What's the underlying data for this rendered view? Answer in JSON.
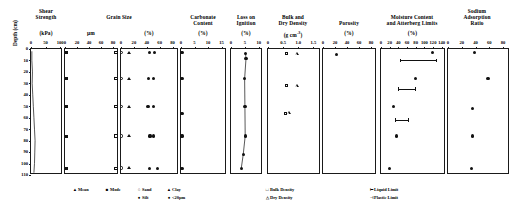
{
  "figure": {
    "depth_axis": {
      "title": "Depth (cm)",
      "ticks": [
        0,
        10,
        20,
        30,
        40,
        50,
        60,
        70,
        80,
        90,
        100,
        110
      ],
      "min": 0,
      "max": 110
    },
    "panels": [
      {
        "id": "shear-strength",
        "title_lines": [
          "Shear",
          "Strength"
        ],
        "unit": "(kPa)",
        "ticks": [
          0,
          50,
          100
        ],
        "min": 0,
        "max": 110
      },
      {
        "id": "grain-size-um",
        "title_lines": [
          "Grain Size"
        ],
        "unit": "µm",
        "ticks": [
          0,
          20,
          40,
          60,
          80
        ],
        "min": 0,
        "max": 90
      },
      {
        "id": "grain-size-pct",
        "title_lines": [],
        "unit": "(%)",
        "ticks": [
          0,
          20,
          40,
          60,
          80
        ],
        "min": 0,
        "max": 90
      },
      {
        "id": "carbonate-content",
        "title_lines": [
          "Carbonate",
          "Content"
        ],
        "unit": "(%)",
        "ticks": [
          0,
          5,
          10,
          15
        ],
        "min": 0,
        "max": 17
      },
      {
        "id": "loss-on-ignition",
        "title_lines": [
          "Loss on",
          "Ignition"
        ],
        "unit": "(%)",
        "ticks": [
          0,
          5,
          10
        ],
        "min": 0,
        "max": 11.5
      },
      {
        "id": "bulk-dry-density",
        "title_lines": [
          "Bulk and",
          "Dry Density"
        ],
        "unit": "(g cm-3)",
        "unit_base": "(g cm",
        "unit_sup": "-3",
        "unit_close": ")",
        "ticks": [
          0,
          0.5,
          1.0,
          1.5
        ],
        "min": 0,
        "max": 1.75
      },
      {
        "id": "porosity",
        "title_lines": [
          "Porosity"
        ],
        "unit": "(%)",
        "ticks": [
          0,
          20,
          40,
          60,
          80
        ],
        "min": 0,
        "max": 90
      },
      {
        "id": "moisture-atterberg",
        "title_lines": [
          "Moisture Content",
          "and Atterberg Limits"
        ],
        "unit": "(%)",
        "ticks": [
          0,
          20,
          40,
          60,
          80,
          100,
          120,
          140
        ],
        "min": 0,
        "max": 150
      },
      {
        "id": "sodium-adsorption-ratio",
        "title_lines": [
          "Sodium",
          "Adsorption",
          "Ratio"
        ],
        "unit": "",
        "ticks": [
          0,
          20,
          40,
          60,
          80
        ],
        "min": 0,
        "max": 90
      }
    ],
    "legends": [
      {
        "id": "legend-mean",
        "marker": "▲",
        "label": "Mean"
      },
      {
        "id": "legend-mode",
        "marker": "■",
        "label": "Mode"
      },
      {
        "id": "legend-sand",
        "marker": "○",
        "label": "Sand"
      },
      {
        "id": "legend-clay",
        "marker": "▲",
        "label": "Clay"
      },
      {
        "id": "legend-silt",
        "marker": "●",
        "label": "Silt"
      },
      {
        "id": "legend-u20",
        "marker": "●",
        "label": "<20µm"
      },
      {
        "id": "legend-bulk-density",
        "marker": "□",
        "label": "Bulk Density"
      },
      {
        "id": "legend-dry-density",
        "marker": "△",
        "label": "Dry Density"
      },
      {
        "id": "legend-liquid-limit",
        "marker": "⊢",
        "label": "Liquid Limit"
      },
      {
        "id": "legend-plastic-limit",
        "marker": "⊣",
        "label": "Plastic Limit"
      }
    ]
  },
  "chart_data": {
    "type": "scatter",
    "ylabel": "Depth (cm)",
    "ylim": [
      0,
      110
    ],
    "grid": false,
    "legend_position": "bottom",
    "subplots": [
      {
        "name": "Shear Strength",
        "xlabel": "Shear Strength (kPa)",
        "xlim": [
          0,
          110
        ],
        "xticks": [
          0,
          50,
          100
        ],
        "series": [
          {
            "name": "Shear strength profile",
            "type": "line",
            "x": [
              3,
              3,
              5,
              4,
              6,
              8,
              10,
              12,
              14,
              13,
              12,
              10
            ],
            "depth": [
              2,
              10,
              20,
              30,
              40,
              50,
              60,
              70,
              80,
              90,
              100,
              108
            ]
          }
        ]
      },
      {
        "name": "Grain Size (um)",
        "xlabel": "Grain Size µm",
        "xlim": [
          0,
          90
        ],
        "xticks": [
          0,
          20,
          40,
          60,
          80
        ],
        "series": [
          {
            "name": "Mode",
            "marker": "filled-square",
            "x": [
              2,
              2,
              2,
              3,
              2
            ],
            "depth": [
              3,
              26,
              50,
              76,
              104
            ]
          },
          {
            "name": "Mean",
            "marker": "open-square",
            "x": [
              85,
              85,
              85,
              85,
              85
            ],
            "depth": [
              3,
              26,
              50,
              76,
              104
            ]
          }
        ]
      },
      {
        "name": "Grain Size (%)",
        "xlabel": "Grain Size (%)",
        "xlim": [
          0,
          90
        ],
        "xticks": [
          0,
          20,
          40,
          60,
          80
        ],
        "series": [
          {
            "name": "Sand",
            "marker": "open-circle",
            "x": [
              1,
              1,
              1,
              1,
              1
            ],
            "depth": [
              3,
              26,
              50,
              76,
              104
            ]
          },
          {
            "name": "Clay",
            "marker": "triangle",
            "x": [
              12,
              13,
              12,
              13,
              12
            ],
            "depth": [
              3,
              26,
              50,
              76,
              104
            ]
          },
          {
            "name": "Silt",
            "marker": "filled-circle",
            "x": [
              44,
              43,
              42,
              45,
              44
            ],
            "depth": [
              3,
              26,
              50,
              76,
              104
            ]
          },
          {
            "name": "<20µm",
            "marker": "filled-circle",
            "x": [
              52,
              50,
              51,
              50,
              57
            ],
            "depth": [
              3,
              26,
              50,
              76,
              104
            ]
          }
        ]
      },
      {
        "name": "Carbonate Content",
        "xlabel": "Carbonate Content (%)",
        "xlim": [
          0,
          17
        ],
        "xticks": [
          0,
          5,
          10,
          15
        ],
        "series": [
          {
            "name": "Carbonate content",
            "marker": "filled-circle",
            "x": [
              0.4,
              0.4,
              0.4,
              0.4,
              0.4
            ],
            "depth": [
              3,
              26,
              56,
              76,
              104
            ]
          }
        ]
      },
      {
        "name": "Loss on Ignition",
        "xlabel": "Loss on Ignition (%)",
        "xlim": [
          0,
          11.5
        ],
        "xticks": [
          0,
          5,
          10
        ],
        "series": [
          {
            "name": "Loss on ignition",
            "type": "line+marker",
            "marker": "filled-circle",
            "x": [
              5.2,
              5.4,
              4.9,
              5.0,
              5.1,
              4.4,
              3.7
            ],
            "depth": [
              4,
              8,
              26,
              50,
              76,
              92,
              104
            ]
          }
        ]
      },
      {
        "name": "Bulk and Dry Density",
        "xlabel": "Bulk and Dry Density (g cm-3)",
        "xlim": [
          0,
          1.75
        ],
        "xticks": [
          0,
          0.5,
          1.0,
          1.5
        ],
        "series": [
          {
            "name": "Bulk Density",
            "marker": "open-square",
            "x": [
              0.62,
              0.62,
              0.58
            ],
            "depth": [
              4,
              32,
              56
            ]
          },
          {
            "name": "Dry Density",
            "marker": "open-triangle",
            "x": [
              0.95,
              0.95,
              0.68
            ],
            "depth": [
              4,
              32,
              56
            ]
          }
        ]
      },
      {
        "name": "Porosity",
        "xlabel": "Porosity (%)",
        "xlim": [
          0,
          90
        ],
        "xticks": [
          0,
          20,
          40,
          60,
          80
        ],
        "series": [
          {
            "name": "Porosity",
            "marker": "filled-circle",
            "x": [
              22
            ],
            "depth": [
              5
            ]
          }
        ]
      },
      {
        "name": "Moisture Content and Atterberg Limits",
        "xlabel": "Moisture Content and Atterberg Limits (%)",
        "xlim": [
          0,
          150
        ],
        "xticks": [
          0,
          20,
          40,
          60,
          80,
          100,
          120,
          140
        ],
        "series": [
          {
            "name": "Moisture content",
            "marker": "filled-circle",
            "x": [
              118,
              80,
              28,
              35,
              20
            ],
            "depth": [
              3,
              26,
              50,
              76,
              104
            ]
          },
          {
            "name": "Atterberg limits range",
            "type": "range-bar",
            "bars": [
              {
                "depth": 10,
                "plastic_limit": 44,
                "liquid_limit": 126
              },
              {
                "depth": 35,
                "plastic_limit": 40,
                "liquid_limit": 78
              },
              {
                "depth": 62,
                "plastic_limit": 32,
                "liquid_limit": 62
              }
            ]
          }
        ]
      },
      {
        "name": "Sodium Adsorption Ratio",
        "xlabel": "Sodium Adsorption Ratio",
        "xlim": [
          0,
          90
        ],
        "xticks": [
          0,
          20,
          40,
          60,
          80
        ],
        "series": [
          {
            "name": "Sodium adsorption ratio",
            "marker": "filled-circle",
            "x": [
              38,
              58,
              36,
              36,
              34
            ],
            "depth": [
              3,
              26,
              52,
              76,
              104
            ]
          }
        ]
      }
    ]
  }
}
